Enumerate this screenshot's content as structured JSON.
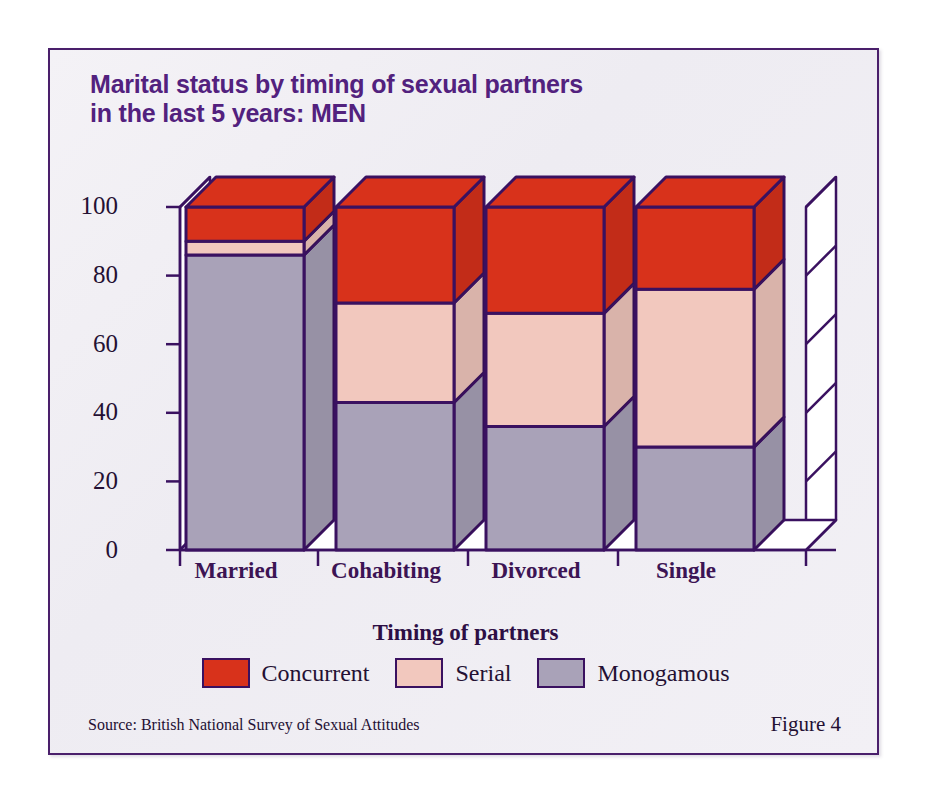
{
  "figure": {
    "title": "Marital status by timing of sexual partners\nin the last 5 years: MEN",
    "source": "Source: British National Survey of Sexual Attitudes",
    "number": "Figure 4",
    "border_color": "#4a1f6b",
    "panel_color": "#f1eff5"
  },
  "chart_data": {
    "type": "bar",
    "subtype": "stacked-3d-column",
    "title": "Marital status by timing of sexual partners in the last 5 years: MEN",
    "xlabel": "",
    "ylabel": "",
    "ylim": [
      0,
      110
    ],
    "yticks": [
      0,
      20,
      40,
      60,
      80,
      100
    ],
    "grid": false,
    "legend_title": "Timing of partners",
    "legend_position": "bottom",
    "categories": [
      "Married",
      "Cohabiting",
      "Divorced",
      "Single"
    ],
    "series": [
      {
        "name": "Monogamous",
        "color": "#a9a2b8",
        "values": [
          86,
          43,
          36,
          30
        ]
      },
      {
        "name": "Serial",
        "color": "#f2c8be",
        "values": [
          4,
          29,
          33,
          46
        ]
      },
      {
        "name": "Concurrent",
        "color": "#d8321b",
        "values": [
          10,
          28,
          31,
          24
        ]
      }
    ],
    "stack_tops": {
      "Married": {
        "monogamous": 86,
        "serial": 90,
        "concurrent": 100
      },
      "Cohabiting": {
        "monogamous": 43,
        "serial": 72,
        "concurrent": 100
      },
      "Divorced": {
        "monogamous": 36,
        "serial": 69,
        "concurrent": 100
      },
      "Single": {
        "monogamous": 30,
        "serial": 76,
        "concurrent": 100
      }
    },
    "outline_color": "#3a1160"
  },
  "legend": {
    "title": "Timing of partners",
    "items": [
      {
        "label": "Concurrent",
        "color": "#d8321b"
      },
      {
        "label": "Serial",
        "color": "#f2c8be"
      },
      {
        "label": "Monogamous",
        "color": "#a9a2b8"
      }
    ]
  },
  "axis": {
    "y_labels": [
      "100",
      "80",
      "60",
      "40",
      "20",
      "0"
    ],
    "x_labels": [
      "Married",
      "Cohabiting",
      "Divorced",
      "Single"
    ]
  }
}
